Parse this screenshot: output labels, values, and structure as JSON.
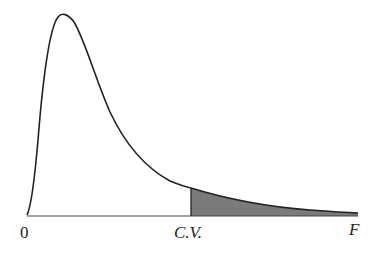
{
  "diagram": {
    "type": "F-distribution density curve with shaded right-tail rejection region",
    "labels": {
      "origin": "0",
      "critical_value": "C.V.",
      "axis": "F"
    },
    "colors": {
      "curve": "#222222",
      "axis": "#444444",
      "shaded_region": "#7a7a7a",
      "background": "#ffffff"
    },
    "shaded_region": "right tail beyond C.V."
  }
}
